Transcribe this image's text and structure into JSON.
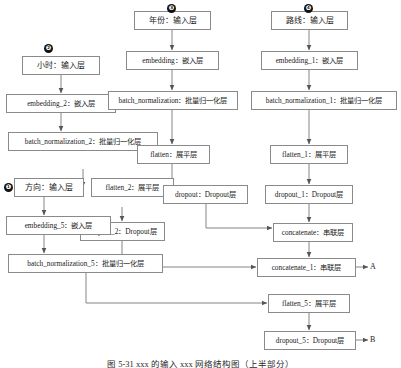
{
  "figure": {
    "caption": "图 5-31  xxx 的输入 xxx 网络结构图（上半部分）",
    "output_labels": [
      {
        "id": "A",
        "text": "A"
      },
      {
        "id": "B",
        "text": "B"
      }
    ],
    "markers": [
      {
        "id": "m1",
        "text": "❶"
      },
      {
        "id": "m2",
        "text": "❷"
      },
      {
        "id": "m3",
        "text": "❸"
      },
      {
        "id": "m4",
        "text": "❹"
      }
    ],
    "colors": {
      "box_border": "#8a8a8a",
      "box_fill": "#ffffff",
      "edge": "#666666",
      "text": "#1a1a1a",
      "marker_fill": "#111111"
    }
  },
  "nodes": [
    {
      "id": "input_hour",
      "label": "小时：输入层"
    },
    {
      "id": "embedding_2",
      "label": "embedding_2：嵌入层"
    },
    {
      "id": "batchnorm_2",
      "label": "batch_normalization_2：批量归一化层"
    },
    {
      "id": "flatten_2",
      "label": "flatten_2：展平层"
    },
    {
      "id": "dropout_2",
      "label": "dropout_2：Dropout层"
    },
    {
      "id": "input_year",
      "label": "年份：输入层"
    },
    {
      "id": "embedding",
      "label": "embedding：嵌入层"
    },
    {
      "id": "batchnorm",
      "label": "batch_normalization：批量归一化层"
    },
    {
      "id": "flatten",
      "label": "flatten：展平层"
    },
    {
      "id": "dropout",
      "label": "dropout：Dropout层"
    },
    {
      "id": "input_route",
      "label": "路线：输入层"
    },
    {
      "id": "embedding_1",
      "label": "embedding_1：嵌入层"
    },
    {
      "id": "batchnorm_1",
      "label": "batch_normalization_1：批量归一化层"
    },
    {
      "id": "flatten_1",
      "label": "flatten_1：展平层"
    },
    {
      "id": "dropout_1",
      "label": "dropout_1：Dropout层"
    },
    {
      "id": "input_dir",
      "label": "方向：输入层"
    },
    {
      "id": "embedding_5",
      "label": "embedding_5：嵌入层"
    },
    {
      "id": "batchnorm_5",
      "label": "batch_normalization_5：批量归一化层"
    },
    {
      "id": "concatenate",
      "label": "concatenate：串联层"
    },
    {
      "id": "concatenate_1",
      "label": "concatenate_1：串联层"
    },
    {
      "id": "flatten_5",
      "label": "flatten_5：展平层"
    },
    {
      "id": "dropout_5",
      "label": "dropout_5：Dropout层"
    }
  ],
  "edges": [
    {
      "from": "input_hour",
      "to": "embedding_2"
    },
    {
      "from": "embedding_2",
      "to": "batchnorm_2"
    },
    {
      "from": "batchnorm_2",
      "to": "flatten_2"
    },
    {
      "from": "flatten_2",
      "to": "dropout_2"
    },
    {
      "from": "dropout_2",
      "to": "concatenate_1"
    },
    {
      "from": "input_year",
      "to": "embedding"
    },
    {
      "from": "embedding",
      "to": "batchnorm"
    },
    {
      "from": "batchnorm",
      "to": "flatten"
    },
    {
      "from": "flatten",
      "to": "dropout"
    },
    {
      "from": "dropout",
      "to": "concatenate"
    },
    {
      "from": "input_route",
      "to": "embedding_1"
    },
    {
      "from": "embedding_1",
      "to": "batchnorm_1"
    },
    {
      "from": "batchnorm_1",
      "to": "flatten_1"
    },
    {
      "from": "flatten_1",
      "to": "dropout_1"
    },
    {
      "from": "dropout_1",
      "to": "concatenate"
    },
    {
      "from": "concatenate",
      "to": "concatenate_1"
    },
    {
      "from": "concatenate_1",
      "to": "A"
    },
    {
      "from": "input_dir",
      "to": "embedding_5"
    },
    {
      "from": "embedding_5",
      "to": "batchnorm_5"
    },
    {
      "from": "batchnorm_5",
      "to": "flatten_5"
    },
    {
      "from": "flatten_5",
      "to": "dropout_5"
    },
    {
      "from": "dropout_5",
      "to": "B"
    }
  ]
}
